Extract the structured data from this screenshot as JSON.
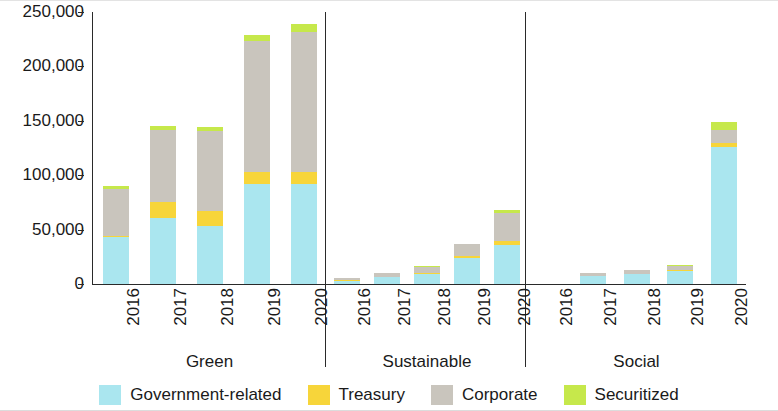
{
  "chart_data": {
    "type": "bar",
    "subtype": "stacked-grouped",
    "title": "",
    "xlabel": "",
    "ylabel": "",
    "ylim": [
      0,
      250000
    ],
    "ytick_labels": [
      "0",
      "50,000",
      "100,000",
      "150,000",
      "200,000",
      "250,000"
    ],
    "ytick_values": [
      0,
      50000,
      100000,
      150000,
      200000,
      250000
    ],
    "grid": false,
    "legend_position": "bottom",
    "groups": [
      "Green",
      "Sustainable",
      "Social"
    ],
    "categories": [
      "2016",
      "2017",
      "2018",
      "2019",
      "2020"
    ],
    "series": [
      {
        "name": "Government-related",
        "color": "#aae6ef",
        "values": {
          "Green": [
            43000,
            61000,
            53000,
            92000,
            92000
          ],
          "Sustainable": [
            3000,
            6000,
            9000,
            24000,
            36000
          ],
          "Social": [
            0,
            7000,
            9000,
            12000,
            126000
          ]
        }
      },
      {
        "name": "Treasury",
        "color": "#f7d53a",
        "values": {
          "Green": [
            1500,
            14000,
            14000,
            11000,
            11000
          ],
          "Sustainable": [
            300,
            500,
            800,
            1500,
            4000
          ],
          "Social": [
            0,
            300,
            500,
            800,
            4000
          ]
        }
      },
      {
        "name": "Corporate",
        "color": "#c9c5bd",
        "values": {
          "Green": [
            43000,
            67000,
            74000,
            120000,
            129000
          ],
          "Sustainable": [
            2000,
            3500,
            6000,
            11000,
            25000
          ],
          "Social": [
            0,
            2500,
            3500,
            4000,
            12000
          ]
        }
      },
      {
        "name": "Securitized",
        "color": "#c6e84b",
        "values": {
          "Green": [
            2500,
            3000,
            3000,
            6000,
            7000
          ],
          "Sustainable": [
            200,
            300,
            400,
            700,
            3000
          ],
          "Social": [
            0,
            200,
            300,
            400,
            7000
          ]
        }
      }
    ],
    "legend": [
      {
        "label": "Government-related",
        "color": "#aae6ef"
      },
      {
        "label": "Treasury",
        "color": "#f7d53a"
      },
      {
        "label": "Corporate",
        "color": "#c9c5bd"
      },
      {
        "label": "Securitized",
        "color": "#c6e84b"
      }
    ]
  }
}
